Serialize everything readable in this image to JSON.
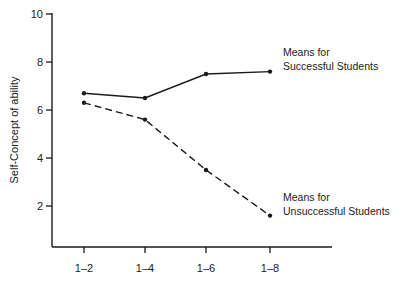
{
  "chart_data": {
    "type": "line",
    "title": "",
    "xlabel": "",
    "ylabel": "Self-Concept of ability",
    "categories": [
      "1–2",
      "1–4",
      "1–6",
      "1–8"
    ],
    "ylim": [
      0.4,
      10
    ],
    "yticks": [
      2,
      4,
      6,
      8,
      10
    ],
    "grid": false,
    "legend": "inline annotations at line ends",
    "series": [
      {
        "name": "Means for Successful Students",
        "label_lines": [
          "Means for",
          "Successful Students"
        ],
        "style": "solid",
        "values": [
          6.7,
          6.5,
          7.5,
          7.6
        ]
      },
      {
        "name": "Means for Unsuccessful Students",
        "label_lines": [
          "Means for",
          "Unsuccessful Students"
        ],
        "style": "dashed",
        "values": [
          6.3,
          5.6,
          3.5,
          1.6
        ]
      }
    ]
  },
  "colors": {
    "ink": "#1a1a1a",
    "background": "#ffffff"
  }
}
